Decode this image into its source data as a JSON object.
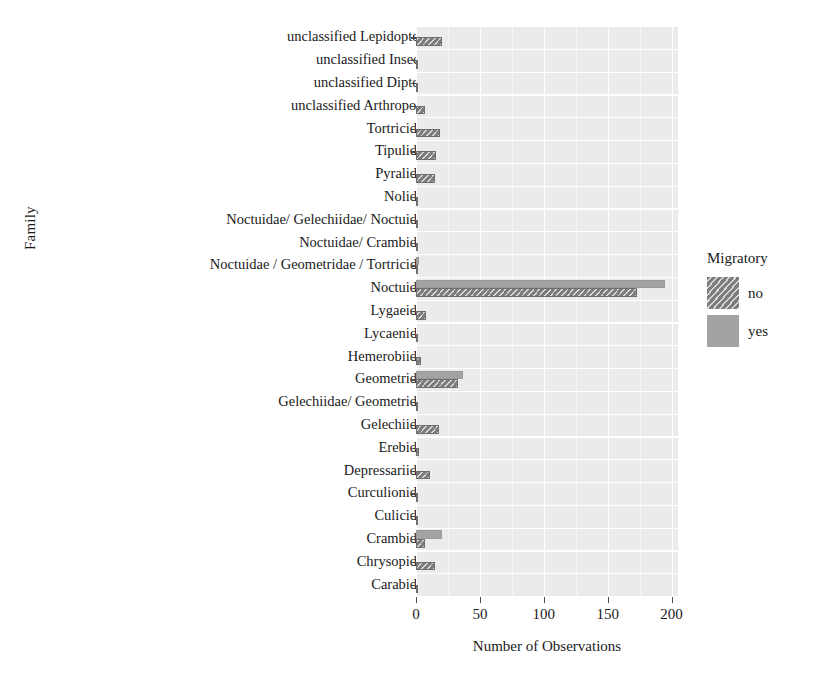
{
  "chart_data": {
    "type": "bar",
    "orientation": "horizontal",
    "title": "",
    "xlabel": "Number of Observations",
    "ylabel": "Family",
    "xlim": [
      0,
      205
    ],
    "xticks": [
      0,
      50,
      100,
      150,
      200
    ],
    "xtick_labels": [
      "0",
      "50",
      "100",
      "150",
      "200"
    ],
    "grid": true,
    "legend": {
      "title": "Migratory",
      "position": "right",
      "entries": [
        {
          "label": "no",
          "color": "#7d7d7d",
          "pattern": "diagonal-hatch"
        },
        {
          "label": "yes",
          "color": "#a3a3a3",
          "pattern": "solid"
        }
      ]
    },
    "categories": [
      "unclassified Lepidoptera",
      "unclassified Insecta",
      "unclassified Diptera",
      "unclassified Arthropoda",
      "Tortricidae",
      "Tipulidae",
      "Pyralidae",
      "Nolidae",
      "Noctuidae/ Gelechiidae/ Noctuidae",
      "Noctuidae/ Crambidae",
      "Noctuidae / Geometridae / Tortricidae",
      "Noctuidae",
      "Lygaeidae",
      "Lycaenidae",
      "Hemerobiidae",
      "Geometridae",
      "Gelechiidae/ Geometridae",
      "Gelechiidae",
      "Erebidae",
      "Depressariidae",
      "Curculionidae",
      "Culicidae",
      "Crambidae",
      "Chrysopidae",
      "Carabidae"
    ],
    "series": [
      {
        "name": "no",
        "values": [
          20,
          1,
          1,
          7,
          19,
          16,
          15,
          1,
          1,
          1,
          1,
          173,
          8,
          1,
          4,
          33,
          1,
          18,
          2,
          11,
          1,
          1,
          7,
          15,
          1
        ]
      },
      {
        "name": "yes",
        "values": [
          0,
          0,
          0,
          0,
          0,
          0,
          0,
          0,
          0,
          0,
          2,
          195,
          0,
          0,
          0,
          37,
          0,
          0,
          0,
          0,
          0,
          0,
          20,
          0,
          0
        ]
      }
    ]
  },
  "colors": {
    "panel_background": "#ebebeb",
    "grid_major": "#ffffff",
    "axis_text": "#1a1a1a",
    "bar_no": "#7d7d7d",
    "bar_yes": "#a3a3a3"
  }
}
